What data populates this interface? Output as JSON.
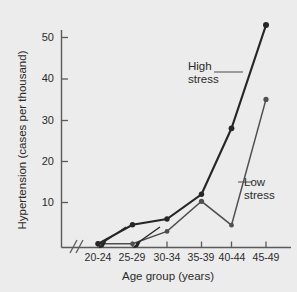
{
  "chart_data": {
    "type": "line",
    "title": "",
    "xlabel": "Age group (years)",
    "ylabel": "Hypertension (cases per thousand)",
    "categories": [
      "20-24",
      "25-29",
      "30-34",
      "35-39",
      "40-44",
      "45-49"
    ],
    "ylim": [
      0,
      56
    ],
    "yticks": [
      10,
      20,
      30,
      40,
      50
    ],
    "ytick_labels": [
      "10",
      "20",
      "30",
      "40",
      "50"
    ],
    "grid": false,
    "legend_position": "inline-annotations",
    "x_axis_break": "//",
    "series": [
      {
        "name": "High stress",
        "values": [
          0,
          4.6,
          6,
          12,
          28,
          53
        ],
        "color": "#262626",
        "marker": "circle"
      },
      {
        "name": "Low stress",
        "values": [
          0,
          0,
          3,
          10.3,
          4.5,
          35
        ],
        "color": "#4f4f4f",
        "marker": "circle"
      }
    ],
    "annotations": [
      {
        "text": "High\nstress",
        "series": "High stress"
      },
      {
        "text": "Low\nstress",
        "series": "Low stress"
      }
    ]
  },
  "axis": {
    "y_tick_0": "10",
    "y_tick_1": "20",
    "y_tick_2": "30",
    "y_tick_3": "40",
    "y_tick_4": "50",
    "x_tick_0": "20-24",
    "x_tick_1": "25-29",
    "x_tick_2": "30-34",
    "x_tick_3": "35-39",
    "x_tick_4": "40-44",
    "x_tick_5": "45-49",
    "x_title": "Age group (years)",
    "y_title": "Hypertension (cases per thousand)"
  },
  "labels": {
    "high_stress": "High\nstress",
    "low_stress": "Low\nstress"
  }
}
